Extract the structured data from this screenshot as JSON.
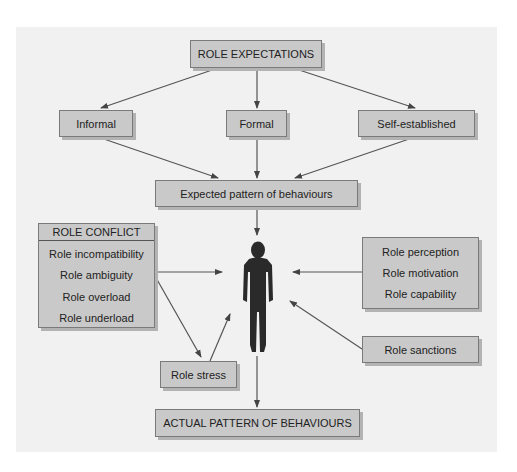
{
  "diagram": {
    "top": {
      "label": "ROLE EXPECTATIONS"
    },
    "sources": [
      {
        "label": "Informal"
      },
      {
        "label": "Formal"
      },
      {
        "label": "Self-established"
      }
    ],
    "expected": {
      "label": "Expected pattern of behaviours"
    },
    "role_conflict": {
      "title": "ROLE CONFLICT",
      "items": [
        "Role incompatibility",
        "Role ambiguity",
        "Role overload",
        "Role underload"
      ]
    },
    "individual_factors": {
      "items": [
        "Role perception",
        "Role motivation",
        "Role capability"
      ]
    },
    "sanctions": {
      "label": "Role sanctions"
    },
    "stress": {
      "label": "Role stress"
    },
    "actual": {
      "label": "ACTUAL PATTERN OF BEHAVIOURS"
    },
    "person": {
      "icon": "person-silhouette-icon"
    },
    "colors": {
      "box_fill": "#c9c9c9",
      "box_border": "#7a7a7a",
      "arrow": "#444444",
      "background_panel": "#f1f1f1"
    }
  }
}
